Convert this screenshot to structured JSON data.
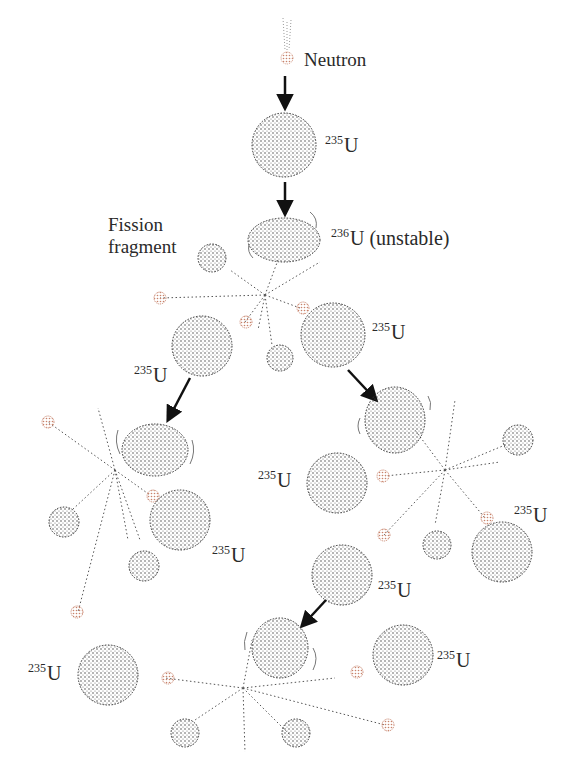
{
  "diagram": {
    "type": "nuclear-fission-chain-reaction",
    "labels": {
      "neutron": "Neutron",
      "fission_fragment_line1": "Fission",
      "fission_fragment_line2": "fragment",
      "u236_mass": "236",
      "u236_symbol": "U",
      "u236_note": " (unstable)",
      "u235_mass": "235",
      "u235_symbol": "U"
    },
    "colors": {
      "nucleus_dots": "#333333",
      "neutron": "#c8826a",
      "arrow": "#111111",
      "trajectory": "#555555"
    },
    "nodes": [
      {
        "id": "incoming-neutron",
        "kind": "neutron"
      },
      {
        "id": "u235-target",
        "kind": "nucleus",
        "label": "235U"
      },
      {
        "id": "u236-unstable",
        "kind": "nucleus",
        "label": "236U (unstable)"
      },
      {
        "id": "gen2-u235-left",
        "kind": "nucleus",
        "label": "235U"
      },
      {
        "id": "gen2-u235-right",
        "kind": "nucleus",
        "label": "235U"
      },
      {
        "id": "gen3-u235-left-a",
        "kind": "nucleus",
        "label": "235U"
      },
      {
        "id": "gen3-u235-left-b",
        "kind": "nucleus",
        "label": "235U"
      },
      {
        "id": "gen3-u235-right-a",
        "kind": "nucleus",
        "label": "235U"
      },
      {
        "id": "gen3-u235-right-b",
        "kind": "nucleus",
        "label": "235U"
      },
      {
        "id": "gen3-u235-bottom-left",
        "kind": "nucleus",
        "label": "235U"
      },
      {
        "id": "gen3-u235-bottom-right",
        "kind": "nucleus",
        "label": "235U"
      }
    ]
  }
}
